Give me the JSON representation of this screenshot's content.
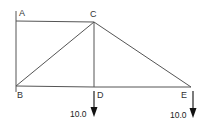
{
  "diagram": {
    "type": "truss",
    "nodes": [
      {
        "id": "A",
        "label": "A",
        "x": 16,
        "y": 21,
        "label_x": 19,
        "label_y": 16
      },
      {
        "id": "C",
        "label": "C",
        "x": 94,
        "y": 22,
        "label_x": 90,
        "label_y": 17
      },
      {
        "id": "B",
        "label": "B",
        "x": 16,
        "y": 86,
        "label_x": 17,
        "label_y": 98
      },
      {
        "id": "D",
        "label": "D",
        "x": 94,
        "y": 87,
        "label_x": 97,
        "label_y": 98
      },
      {
        "id": "E",
        "label": "E",
        "x": 191,
        "y": 87,
        "label_x": 181,
        "label_y": 98
      }
    ],
    "members": [
      {
        "from": "A",
        "to": "C"
      },
      {
        "from": "A",
        "to": "B"
      },
      {
        "from": "B",
        "to": "C"
      },
      {
        "from": "C",
        "to": "D"
      },
      {
        "from": "C",
        "to": "E"
      },
      {
        "from": "B",
        "to": "D"
      },
      {
        "from": "D",
        "to": "E"
      }
    ],
    "loads": [
      {
        "at": "D",
        "value": "10.0",
        "direction": "down",
        "x": 94,
        "y1": 91,
        "y2": 117,
        "label_x": 70,
        "label_y": 117
      },
      {
        "at": "E",
        "value": "10.0",
        "direction": "down",
        "x": 193,
        "y1": 91,
        "y2": 118,
        "label_x": 170,
        "label_y": 118
      }
    ],
    "colors": {
      "member": "#555555",
      "load": "#222222",
      "label": "#333333",
      "background": "#ffffff"
    }
  }
}
